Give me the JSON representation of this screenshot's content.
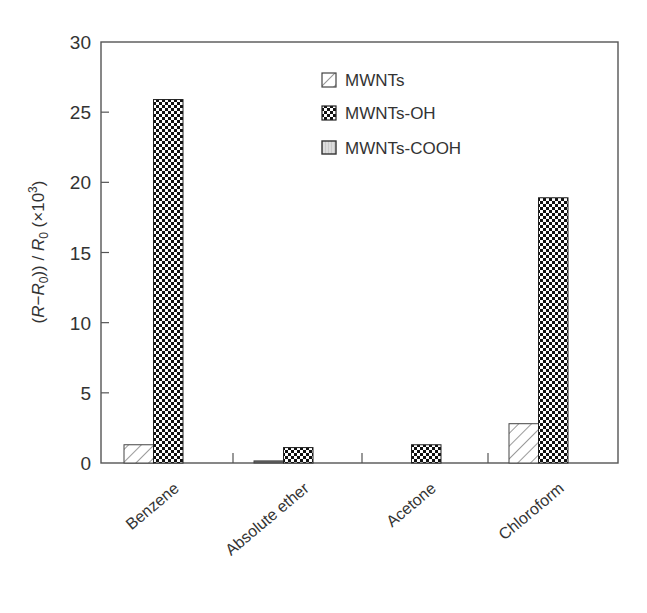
{
  "chart_data": {
    "type": "bar",
    "title": "",
    "xlabel": "",
    "ylabel": "(R−R0)) / R0 (×10³)",
    "ylabel_parts": {
      "open": "(",
      "r1": "R",
      "minus": "−",
      "r2": "R",
      "sub1": "0",
      "close": "))",
      "slash": " / ",
      "r3": "R",
      "sub2": "0",
      "mult": " (×10",
      "sup": "3",
      "end": ")"
    },
    "ylim": [
      0,
      30
    ],
    "yticks": [
      0,
      5,
      10,
      15,
      20,
      25,
      30
    ],
    "ytick_labels": [
      "0",
      "5",
      "10",
      "15",
      "20",
      "25",
      "30"
    ],
    "grid": false,
    "legend_position": "upper-center-right",
    "categories": [
      "Benzene",
      "Absolute ether",
      "Acetone",
      "Chloroform"
    ],
    "series": [
      {
        "name": "MWNTs",
        "pattern": "diagonal-hatch",
        "values": [
          1.3,
          0.15,
          0.0,
          2.8
        ]
      },
      {
        "name": "MWNTs-OH",
        "pattern": "checkerboard",
        "values": [
          25.9,
          1.1,
          1.3,
          18.9
        ]
      },
      {
        "name": "MWNTs-COOH",
        "pattern": "light-gray-vertical",
        "values": [
          0.0,
          0.0,
          0.0,
          0.0
        ]
      }
    ]
  },
  "legend": {
    "items": [
      {
        "label": "MWNTs",
        "pattern": "diagonal-hatch"
      },
      {
        "label": "MWNTs-OH",
        "pattern": "checkerboard"
      },
      {
        "label": "MWNTs-COOH",
        "pattern": "light-gray-vertical"
      }
    ]
  },
  "colors": {
    "axis": "#555555",
    "bar_outline": "#333333",
    "checker_dark": "#111111",
    "checker_light": "#ffffff",
    "cooh_fill": "#dcdcdc",
    "text": "#333333"
  }
}
